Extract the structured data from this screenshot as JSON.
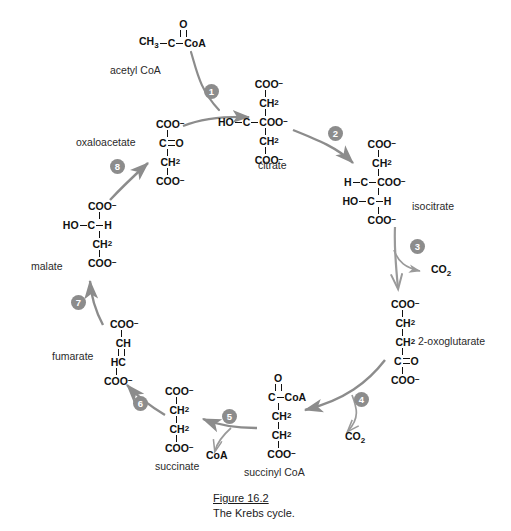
{
  "figure": {
    "number": "Figure 16.2",
    "title": "The Krebs cycle."
  },
  "colors": {
    "arrow": "#8c8c8c",
    "badge_fill": "#8c8c8c",
    "badge_text": "#ffffff",
    "text": "#1a1a1a",
    "background": "#ffffff"
  },
  "molecules": [
    {
      "id": "acetyl-coa",
      "label": "acetyl CoA",
      "formula_lines": [
        "O",
        "||",
        "CH3-C-CoA"
      ],
      "atoms": {
        "methyl": "CH",
        "methyl_sub": "3",
        "carbonyl": "C",
        "thioester": "CoA",
        "oxygen": "O"
      }
    },
    {
      "id": "citrate",
      "label": "citrate",
      "formula_lines": [
        "COO-",
        "CH2",
        "HO-C-COO-",
        "CH2",
        "COO-"
      ]
    },
    {
      "id": "isocitrate",
      "label": "isocitrate",
      "formula_lines": [
        "COO-",
        "CH2",
        "H-C-COO-",
        "HO-C-H",
        "COO-"
      ]
    },
    {
      "id": "2-oxoglutarate",
      "label": "2-oxoglutarate",
      "formula_lines": [
        "COO-",
        "CH2",
        "CH2",
        "C=O",
        "COO-"
      ]
    },
    {
      "id": "succinyl-coa",
      "label": "succinyl CoA",
      "formula_lines": [
        "O",
        "||",
        "C-CoA",
        "CH2",
        "CH2",
        "COO-"
      ]
    },
    {
      "id": "succinate",
      "label": "succinate",
      "formula_lines": [
        "COO-",
        "CH2",
        "CH2",
        "COO-"
      ]
    },
    {
      "id": "fumarate",
      "label": "fumarate",
      "formula_lines": [
        "COO-",
        "CH",
        "||",
        "HC",
        "COO-"
      ]
    },
    {
      "id": "malate",
      "label": "malate",
      "formula_lines": [
        "COO-",
        "HO-C-H",
        "CH2",
        "COO-"
      ]
    },
    {
      "id": "oxaloacetate",
      "label": "oxaloacetate",
      "formula_lines": [
        "COO-",
        "C=O",
        "CH2",
        "COO-"
      ]
    }
  ],
  "steps": [
    {
      "number": "1",
      "from": "oxaloacetate",
      "to": "citrate"
    },
    {
      "number": "2",
      "from": "citrate",
      "to": "isocitrate"
    },
    {
      "number": "3",
      "from": "isocitrate",
      "to": "2-oxoglutarate",
      "releases": "CO2"
    },
    {
      "number": "4",
      "from": "2-oxoglutarate",
      "to": "succinyl CoA",
      "releases": "CO2"
    },
    {
      "number": "5",
      "from": "succinyl CoA",
      "to": "succinate",
      "releases": "CoA"
    },
    {
      "number": "6",
      "from": "succinate",
      "to": "fumarate"
    },
    {
      "number": "7",
      "from": "fumarate",
      "to": "malate"
    },
    {
      "number": "8",
      "from": "malate",
      "to": "oxaloacetate"
    }
  ],
  "products": [
    {
      "id": "co2-step3",
      "label": "CO",
      "sub": "2"
    },
    {
      "id": "co2-step4",
      "label": "CO",
      "sub": "2"
    },
    {
      "id": "coa-step5",
      "label": "CoA",
      "sub": ""
    }
  ],
  "chem_text": {
    "coo_minus": "COO",
    "minus": "−",
    "ch2": "CH",
    "two": "2",
    "three": "3",
    "ho": "HO",
    "h": "H",
    "c": "C",
    "o": "O",
    "ch": "CH",
    "hc": "HC",
    "coa": "CoA",
    "ch3": "CH"
  }
}
